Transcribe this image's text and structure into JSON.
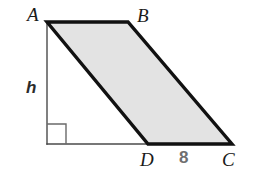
{
  "figure": {
    "shape_type": "parallelogram",
    "background_color": "#ffffff",
    "fill_color": "#e3e3e3",
    "stroke_color": "#111111",
    "stroke_width": 3.2,
    "helper_line_color": "#555555",
    "helper_line_width": 1.3,
    "measure_text_color": "#6f6f6f",
    "vertices": [
      {
        "name": "A",
        "label": "A",
        "x": 47,
        "y": 22,
        "label_x": 27,
        "label_y": 5
      },
      {
        "name": "B",
        "label": "B",
        "x": 128,
        "y": 22,
        "label_x": 137,
        "label_y": 6
      },
      {
        "name": "C",
        "label": "C",
        "x": 232,
        "y": 144,
        "label_x": 222,
        "label_y": 150
      },
      {
        "name": "D",
        "label": "D",
        "x": 148,
        "y": 144,
        "label_x": 140,
        "label_y": 150
      }
    ],
    "polygon_points": "47,22 128,22 232,144 148,144",
    "height_line": {
      "label": "h",
      "from_x": 47,
      "from_y": 22,
      "to_x": 47,
      "to_y": 144,
      "label_x": 26,
      "label_y": 79
    },
    "base_line": {
      "from_x": 47,
      "from_y": 144,
      "to_x": 232,
      "to_y": 144
    },
    "right_angle_marker": {
      "x": 47,
      "y": 124,
      "size": 19,
      "description": "right-angle square at foot of height"
    },
    "measurements": [
      {
        "name": "segment-DC",
        "value": "8",
        "label_x": 179,
        "label_y": 149
      }
    ]
  }
}
